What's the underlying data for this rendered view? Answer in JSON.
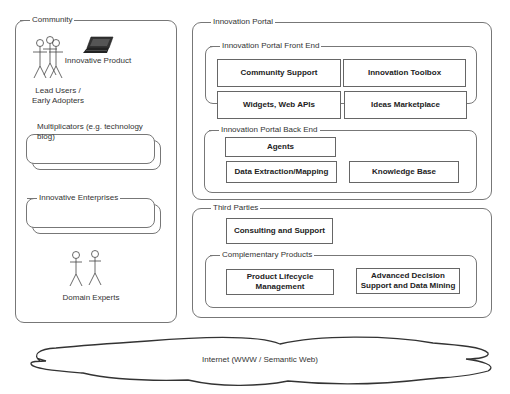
{
  "community": {
    "title": "Community",
    "lead_users_line1": "Lead Users /",
    "lead_users_line2": "Early Adopters",
    "innovative_product": "Innovative Product",
    "multiplicators": "Multiplicators (e.g. technology blog)",
    "multiplicators_line1": "Multiplicators (e.g. technology",
    "multiplicators_line2": "blog)",
    "innovative_enterprises": "Innovative Enterprises",
    "domain_experts": "Domain Experts"
  },
  "portal": {
    "title": "Innovation Portal",
    "front_end": {
      "title": "Innovation Portal Front End",
      "items": [
        "Community Support",
        "Innovation Toolbox",
        "Widgets, Web APIs",
        "Ideas Marketplace"
      ]
    },
    "back_end": {
      "title": "Innovation Portal Back End",
      "items": [
        "Agents",
        "Data Extraction/Mapping",
        "Knowledge Base"
      ]
    }
  },
  "third_parties": {
    "title": "Third Parties",
    "consulting": "Consulting and Support",
    "complementary": {
      "title": "Complementary Products",
      "plm_line1": "Product Lifecycle",
      "plm_line2": "Management",
      "adsdm_line1": "Advanced Decision",
      "adsdm_line2": "Support and Data Mining"
    }
  },
  "internet": {
    "label": "Internet (WWW / Semantic Web)"
  }
}
